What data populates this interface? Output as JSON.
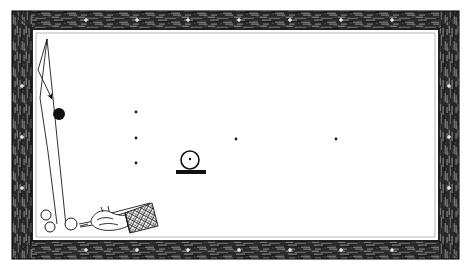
{
  "image": {
    "title": "Billiard table diagram with cue shot trajectory",
    "width": 471,
    "height": 269,
    "background_color": "#ffffff",
    "ink_color": "#1a1a1a",
    "cloth_color": "#ffffff",
    "rail_color": "#3b3b3b",
    "style": "black and white line drawing / halftone engraving"
  },
  "table": {
    "frame_label": "wooden rail frame",
    "outer": {
      "x": 12,
      "y": 11,
      "width": 447,
      "height": 248
    },
    "rail_thickness": 16,
    "inner_playfield": {
      "x": 32,
      "y": 29,
      "width": 407,
      "height": 212
    },
    "bevel_label": "inner rail bevel",
    "rail_markers": {
      "label": "diamond sight markers",
      "color": "#e8e8e8",
      "top": [
        86,
        137,
        188,
        239,
        290,
        341,
        392
      ],
      "bottom": [
        86,
        137,
        188,
        239,
        290,
        341,
        392
      ],
      "left": [
        86,
        137,
        188
      ],
      "right": [
        86,
        137,
        188
      ]
    }
  },
  "shot": {
    "label": "cue ball path and object ball",
    "trajectory_main": "M 66,226 L 47,39",
    "trajectory_rebound": "M 47,39 L 38,70 L 52,99",
    "trajectory_return": "M 47,39 L 40,98 L 48,152 L 57,224",
    "arrow_label": "direction arrow",
    "arrow": {
      "x": 52,
      "y": 99,
      "angle": 48
    },
    "object_ball": {
      "label": "object ball (black)",
      "cx": 59,
      "cy": 114,
      "r": 6,
      "fill": "#111111"
    }
  },
  "spots": {
    "label": "table spots",
    "radius": 1.4,
    "points": [
      {
        "x": 136,
        "y": 112
      },
      {
        "x": 136,
        "y": 138
      },
      {
        "x": 136,
        "y": 163
      },
      {
        "x": 236,
        "y": 139
      },
      {
        "x": 336,
        "y": 139
      }
    ]
  },
  "ball_on_stand": {
    "label": "ball resting on stand",
    "ball": {
      "cx": 190,
      "cy": 160,
      "r": 9
    },
    "center_dot": {
      "cx": 190,
      "cy": 159,
      "r": 1.2
    },
    "base": {
      "x": 176,
      "y": 170,
      "width": 30,
      "height": 4
    }
  },
  "corner_balls": {
    "label": "balls near bottom left cushion",
    "items": [
      {
        "cx": 46,
        "cy": 215,
        "r": 5
      },
      {
        "cx": 50,
        "cy": 227,
        "r": 5
      },
      {
        "cx": 71,
        "cy": 224,
        "r": 6
      }
    ]
  },
  "cue": {
    "label": "hand gripping cue stick",
    "stick": {
      "from_x": 78,
      "from_y": 223,
      "to_x": 152,
      "to_y": 206
    },
    "hand_label": "bridging hand",
    "cuff_label": "crosshatched shirt cuff",
    "cuff": {
      "x": 118,
      "y": 213,
      "width": 36,
      "height": 18
    }
  },
  "annotations": {
    "caption": ""
  }
}
